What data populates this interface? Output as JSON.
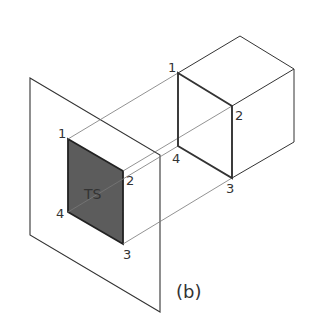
{
  "figure": {
    "caption": "(b)",
    "face_label": "TS",
    "cube_labels": [
      "1",
      "2",
      "3",
      "4"
    ],
    "projection_labels": [
      "1",
      "2",
      "3",
      "4"
    ],
    "colors": {
      "line": "#333333",
      "shade": "#5a5a5a",
      "projector": "#777777"
    }
  }
}
